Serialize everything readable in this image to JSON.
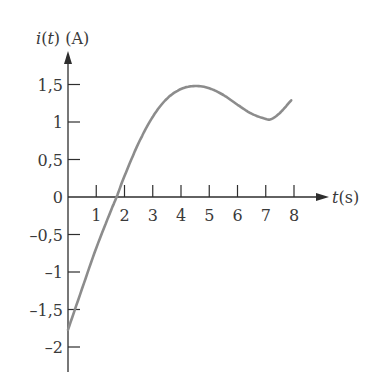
{
  "chart_data": {
    "type": "line",
    "title": "",
    "ylabel": "i(t) (A)",
    "ylabel_parts": {
      "func": "i",
      "var": "t",
      "unit": "(A)"
    },
    "xlabel": "t(s)",
    "xlabel_parts": {
      "var": "t",
      "unit": "(s)"
    },
    "xlim": [
      0,
      8.9
    ],
    "ylim": [
      -2.35,
      1.95
    ],
    "grid": false,
    "legend": null,
    "x_ticks": [
      1,
      2,
      3,
      4,
      5,
      6,
      7,
      8
    ],
    "x_tick_labels": [
      "1",
      "2",
      "3",
      "4",
      "5",
      "6",
      "7",
      "8"
    ],
    "y_ticks": [
      1.5,
      1,
      0.5,
      0,
      -0.5,
      -1,
      -1.5,
      -2
    ],
    "y_tick_labels": [
      "1,5",
      "1",
      "0,5",
      "0",
      "–0,5",
      "–1",
      "–1,5",
      "–2"
    ],
    "series": [
      {
        "name": "i(t)",
        "color": "#8c8c8c",
        "x": [
          0,
          0.5,
          1.0,
          1.5,
          1.72,
          2.0,
          2.5,
          3.0,
          3.5,
          4.0,
          4.5,
          5.0,
          5.5,
          6.0,
          6.5,
          7.0,
          7.2,
          7.5,
          7.9
        ],
        "y": [
          -1.77,
          -1.22,
          -0.68,
          -0.2,
          0.0,
          0.28,
          0.72,
          1.07,
          1.31,
          1.44,
          1.48,
          1.45,
          1.36,
          1.23,
          1.11,
          1.04,
          1.04,
          1.12,
          1.29
        ]
      }
    ]
  }
}
